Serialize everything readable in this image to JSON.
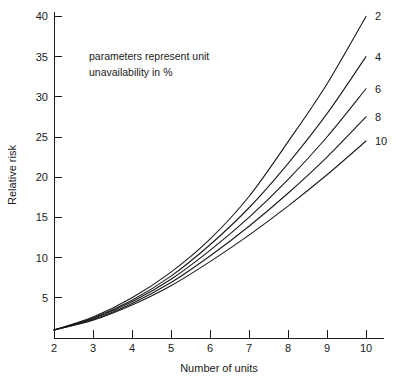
{
  "chart_data": {
    "type": "line",
    "title": "",
    "xlabel": "Number of units",
    "ylabel": "Relative risk",
    "xlim": [
      2,
      10
    ],
    "ylim": [
      0,
      41.5
    ],
    "grid": false,
    "legend_position": "right-of-curve-ends",
    "annotation": "parameters represent unit unavailability in %",
    "annotation_lines": [
      "parameters represent unit",
      "unavailability in %"
    ],
    "xticks": [
      2,
      3,
      4,
      5,
      6,
      7,
      8,
      9,
      10
    ],
    "xtick_labels": [
      "2",
      "3",
      "4",
      "5",
      "6",
      "7",
      "8",
      "9",
      "10"
    ],
    "yticks": [
      5,
      10,
      15,
      20,
      25,
      30,
      35,
      40
    ],
    "ytick_labels": [
      "5",
      "10",
      "15",
      "20",
      "25",
      "30",
      "35",
      "40"
    ],
    "x": [
      2,
      3,
      4,
      5,
      6,
      7,
      8,
      9,
      10
    ],
    "series": [
      {
        "name": "2",
        "label": "2",
        "values": [
          1.0,
          2.6,
          5.0,
          8.2,
          12.3,
          17.6,
          24.4,
          31.6,
          40.0
        ]
      },
      {
        "name": "4",
        "label": "4",
        "values": [
          1.0,
          2.5,
          4.7,
          7.7,
          11.6,
          16.2,
          21.7,
          27.9,
          35.0
        ]
      },
      {
        "name": "6",
        "label": "6",
        "values": [
          1.0,
          2.4,
          4.5,
          7.3,
          10.9,
          15.0,
          19.7,
          25.0,
          31.0
        ]
      },
      {
        "name": "8",
        "label": "8",
        "values": [
          1.0,
          2.3,
          4.3,
          6.9,
          10.2,
          13.9,
          18.0,
          22.5,
          27.5
        ]
      },
      {
        "name": "10",
        "label": "10",
        "values": [
          1.0,
          2.2,
          4.1,
          6.5,
          9.5,
          12.8,
          16.4,
          20.3,
          24.5
        ]
      }
    ]
  },
  "colors": {
    "background": "#ffffff",
    "ink": "#1a1a1a",
    "curve": "#1a1a1a"
  }
}
